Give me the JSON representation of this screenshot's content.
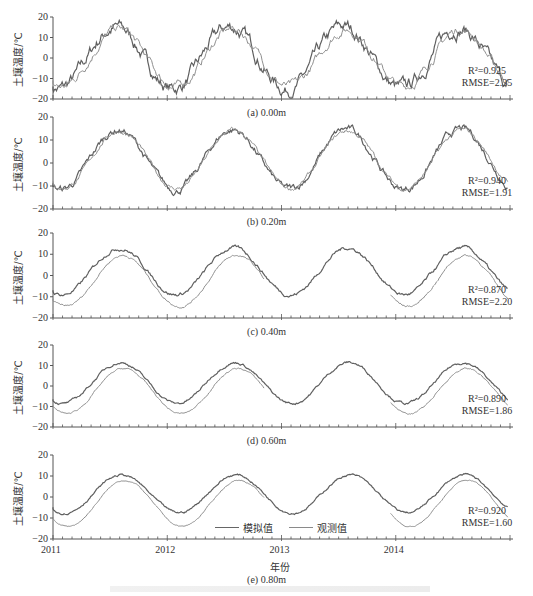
{
  "chart_data": [
    {
      "type": "line",
      "panel": "a",
      "caption": "(a) 0.00m",
      "ylabel": "土壤温度/℃",
      "ylim": [
        -20,
        20
      ],
      "yticks": [
        20,
        10,
        0,
        -10,
        -20
      ],
      "stats": {
        "r2": "R²=0.925",
        "rmse": "RMSE=2.35"
      },
      "series": [
        {
          "name": "模拟值",
          "amp": 15,
          "mean": 0,
          "noise": 3.0,
          "phase": 0
        },
        {
          "name": "观测值",
          "amp": 14,
          "mean": 0,
          "noise": 2.0,
          "phase": 0.02
        }
      ]
    },
    {
      "type": "line",
      "panel": "b",
      "caption": "(b) 0.20m",
      "ylabel": "土壤温度/℃",
      "ylim": [
        -20,
        20
      ],
      "yticks": [
        20,
        10,
        0,
        -10,
        -20
      ],
      "stats": {
        "r2": "R²=0.940",
        "rmse": "RMSE=1.91"
      },
      "series": [
        {
          "name": "模拟值",
          "amp": 13,
          "mean": 1.5,
          "noise": 1.5,
          "phase": 0.02
        },
        {
          "name": "观测值",
          "amp": 12.5,
          "mean": 1.5,
          "noise": 1.0,
          "phase": 0.03
        }
      ]
    },
    {
      "type": "line",
      "panel": "c",
      "caption": "(c) 0.40m",
      "ylabel": "土壤温度/℃",
      "ylim": [
        -20,
        20
      ],
      "yticks": [
        20,
        10,
        0,
        -10,
        -20
      ],
      "stats": {
        "r2": "R²=0.870",
        "rmse": "RMSE=2.20"
      },
      "series": [
        {
          "name": "模拟值",
          "amp": 11,
          "mean": 2,
          "noise": 0.8,
          "phase": 0.03
        },
        {
          "name": "观测值",
          "amp": 12,
          "mean": -2.5,
          "noise": 0.5,
          "phase": 0.06
        }
      ]
    },
    {
      "type": "line",
      "panel": "d",
      "caption": "(d) 0.60m",
      "ylabel": "土壤温度/℃",
      "ylim": [
        -20,
        20
      ],
      "yticks": [
        20,
        10,
        0,
        -10,
        -20
      ],
      "stats": {
        "r2": "R²=0.890",
        "rmse": "RMSE=1.86"
      },
      "series": [
        {
          "name": "模拟值",
          "amp": 10,
          "mean": 1.5,
          "noise": 0.6,
          "phase": 0.04
        },
        {
          "name": "观测值",
          "amp": 11,
          "mean": -2.5,
          "noise": 0.4,
          "phase": 0.07
        }
      ]
    },
    {
      "type": "line",
      "panel": "e",
      "caption": "(e) 0.80m",
      "ylabel": "土壤温度/℃",
      "xlabel": "年份",
      "ylim": [
        -20,
        20
      ],
      "yticks": [
        20,
        10,
        0,
        -10,
        -20
      ],
      "stats": {
        "r2": "R²=0.920",
        "rmse": "RMSE=1.60"
      },
      "series": [
        {
          "name": "模拟值",
          "amp": 9,
          "mean": 1.5,
          "noise": 0.5,
          "phase": 0.05
        },
        {
          "name": "观测值",
          "amp": 11,
          "mean": -3,
          "noise": 0.3,
          "phase": 0.08
        }
      ]
    }
  ],
  "x_axis": {
    "range": [
      2011,
      2015
    ],
    "tick_labels": [
      "2011",
      "2012",
      "2013",
      "2014"
    ],
    "minor_ticks_per_year": 12
  },
  "legend": {
    "simulated": "模拟值",
    "observed": "观测值"
  },
  "colors": {
    "simulated": "#5f5f5f",
    "observed": "#8f8f8f",
    "axis": "#555555"
  }
}
